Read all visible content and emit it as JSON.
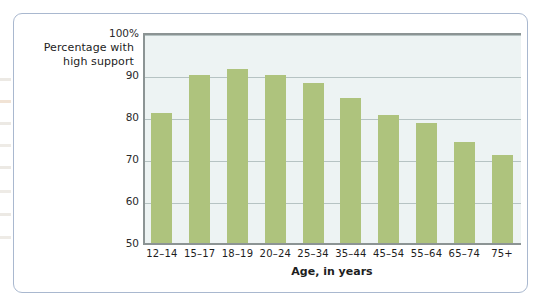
{
  "chart_data": {
    "type": "bar",
    "title": "",
    "subtitle": "",
    "ylabel_line1": "Percentage with",
    "ylabel_line2": "high support",
    "xlabel": "Age, in years",
    "categories": [
      "12–14",
      "15–17",
      "18–19",
      "20–24",
      "25–34",
      "35–44",
      "45–54",
      "55–64",
      "65–74",
      "75+"
    ],
    "values": [
      81,
      90,
      91.5,
      90,
      88,
      84.5,
      80.5,
      78.5,
      74,
      71
    ],
    "ylim": [
      50,
      100
    ],
    "ytick_values": [
      100,
      90,
      80,
      70,
      60,
      50
    ],
    "ytick_labels": [
      "100%",
      "90",
      "80",
      "70",
      "60",
      "50"
    ],
    "grid": true,
    "legend": "none",
    "bar_color": "#aec37d",
    "plot_background": "#edf3f3",
    "gridline_color": "#b6c3c3",
    "axis_color": "#8c9494",
    "frame_color": "#a9b8cf"
  }
}
